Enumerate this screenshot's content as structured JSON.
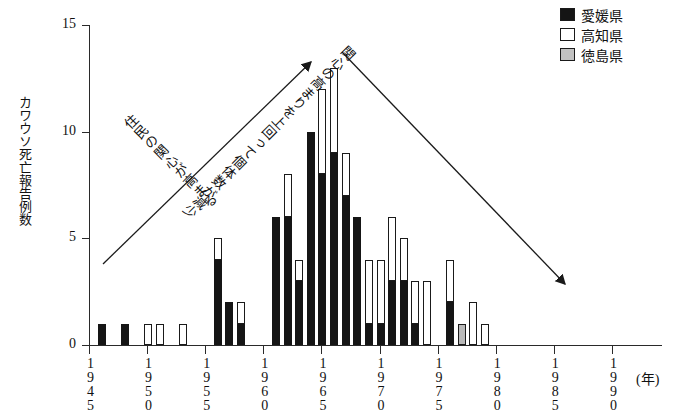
{
  "chart_data": {
    "type": "bar",
    "stacked": true,
    "title": "",
    "xlabel": "(年)",
    "ylabel": "カワウソ死亡報告例数",
    "xlim": [
      1945,
      1990
    ],
    "ylim": [
      0,
      15
    ],
    "ytick_labels": [
      "0",
      "5",
      "10",
      "15"
    ],
    "ytick_values": [
      0,
      5,
      10,
      15
    ],
    "xtick_labels": [
      "1945",
      "1950",
      "1955",
      "1960",
      "1965",
      "1970",
      "1975",
      "1980",
      "1985",
      "1990"
    ],
    "xtick_values": [
      1945,
      1950,
      1955,
      1960,
      1965,
      1970,
      1975,
      1980,
      1985,
      1990
    ],
    "grid": false,
    "legend_position": "top-right",
    "series": [
      {
        "name": "愛媛県",
        "color": "#151515",
        "values": [
          0,
          1,
          0,
          1,
          0,
          0,
          0,
          0,
          0,
          0,
          0,
          4,
          2,
          1,
          0,
          0,
          6,
          6,
          3,
          10,
          8,
          9,
          7,
          6,
          1,
          1,
          3,
          3,
          1,
          0,
          0,
          2,
          0,
          0,
          0,
          0,
          0,
          0,
          0,
          0,
          0,
          0,
          0,
          0,
          0,
          0
        ]
      },
      {
        "name": "高知県",
        "color": "#ffffff",
        "values": [
          0,
          0,
          0,
          0,
          0,
          1,
          1,
          0,
          1,
          0,
          0,
          1,
          0,
          1,
          0,
          0,
          0,
          2,
          1,
          0,
          4,
          4,
          2,
          0,
          3,
          3,
          3,
          2,
          2,
          3,
          0,
          2,
          0,
          2,
          1,
          0,
          0,
          0,
          0,
          0,
          0,
          0,
          0,
          0,
          0,
          0
        ]
      },
      {
        "name": "徳島県",
        "color": "#b9b9b9",
        "values": [
          0,
          0,
          0,
          0,
          0,
          0,
          0,
          0,
          0,
          0,
          0,
          0,
          0,
          0,
          0,
          0,
          0,
          0,
          0,
          0,
          0,
          0,
          0,
          0,
          0,
          0,
          0,
          0,
          0,
          0,
          0,
          0,
          1,
          0,
          0,
          0,
          0,
          0,
          0,
          0,
          0,
          0,
          0,
          0,
          0,
          0
        ]
      }
    ],
    "categories": [
      1945,
      1946,
      1947,
      1948,
      1949,
      1950,
      1951,
      1952,
      1953,
      1954,
      1955,
      1956,
      1957,
      1958,
      1959,
      1960,
      1961,
      1962,
      1963,
      1964,
      1965,
      1966,
      1967,
      1968,
      1969,
      1970,
      1971,
      1972,
      1973,
      1974,
      1975,
      1976,
      1977,
      1978,
      1979,
      1980,
      1981,
      1982,
      1983,
      1984,
      1985,
      1986,
      1987,
      1988,
      1989,
      1990
    ],
    "annotations": [
      {
        "id": "rise",
        "text": "住民の関心が高まる",
        "arrow": "up-right"
      },
      {
        "id": "fall",
        "text": "関心の高まりを上回って個体数が減少",
        "arrow": "down-right"
      }
    ]
  },
  "legend": {
    "items": [
      {
        "label": "愛媛県",
        "swatch": "black-square-icon"
      },
      {
        "label": "高知県",
        "swatch": "white-square-icon"
      },
      {
        "label": "徳島県",
        "swatch": "gray-square-icon"
      }
    ]
  },
  "axes": {
    "y_title": "カワウソ死亡報告例数",
    "x_unit": "(年)"
  }
}
